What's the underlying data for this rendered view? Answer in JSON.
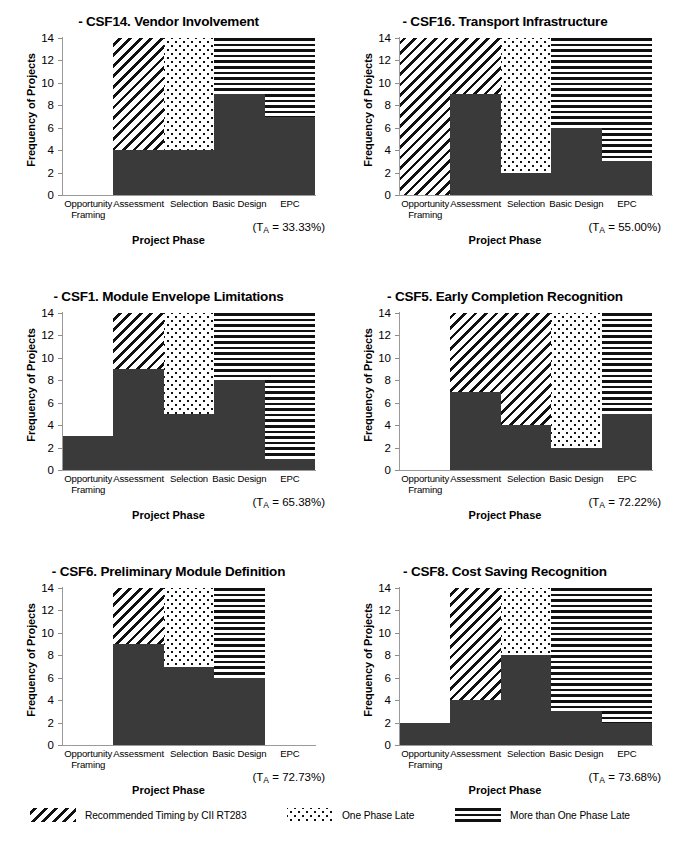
{
  "figure": {
    "axis": {
      "ylabel": "Frequency of Projects",
      "xlabel": "Project Phase",
      "yticks": [
        "14",
        "12",
        "10",
        "8",
        "6",
        "4",
        "2",
        "0"
      ],
      "ylim": [
        0,
        14
      ],
      "categories": [
        "Opportunity Framing",
        "Assessment",
        "Selection",
        "Basic Design",
        "EPC"
      ],
      "category_lines": [
        [
          "Opportunity",
          "Framing"
        ],
        [
          "Assessment",
          ""
        ],
        [
          "Selection",
          ""
        ],
        [
          "Basic Design",
          ""
        ],
        [
          "EPC",
          ""
        ]
      ]
    },
    "legend": {
      "items": [
        {
          "pattern": "hatch",
          "label": "Recommended Timing by CII RT283"
        },
        {
          "pattern": "dots",
          "label": "One Phase Late"
        },
        {
          "pattern": "lines",
          "label": "More than One Phase Late"
        }
      ]
    },
    "colors": {
      "bar_fill": "#3a3a3a",
      "pattern_ink": "#111111",
      "axis_line": "#9a9a9a",
      "background": "#ffffff"
    }
  },
  "chart_data": [
    {
      "type": "bar",
      "title": "- CSF14. Vendor Involvement",
      "xlabel": "Project Phase",
      "ylabel": "Frequency of Projects",
      "ylim": [
        0,
        14
      ],
      "categories": [
        "Opportunity Framing",
        "Assessment",
        "Selection",
        "Basic Design",
        "EPC"
      ],
      "values": [
        0,
        4,
        4,
        9,
        7
      ],
      "zones": [
        "blank",
        "hatch",
        "dots",
        "lines",
        "lines"
      ],
      "annotation": "(T_A = 33.33%)",
      "annotation_value": "33.33%"
    },
    {
      "type": "bar",
      "title": "- CSF16. Transport Infrastructure",
      "xlabel": "Project Phase",
      "ylabel": "Frequency of Projects",
      "ylim": [
        0,
        14
      ],
      "categories": [
        "Opportunity Framing",
        "Assessment",
        "Selection",
        "Basic Design",
        "EPC"
      ],
      "values": [
        0,
        9,
        2,
        6,
        3
      ],
      "zones": [
        "hatch",
        "hatch",
        "dots",
        "lines",
        "lines"
      ],
      "annotation": "(T_A = 55.00%)",
      "annotation_value": "55.00%"
    },
    {
      "type": "bar",
      "title": "- CSF1. Module Envelope Limitations",
      "xlabel": "Project Phase",
      "ylabel": "Frequency of Projects",
      "ylim": [
        0,
        14
      ],
      "categories": [
        "Opportunity Framing",
        "Assessment",
        "Selection",
        "Basic Design",
        "EPC"
      ],
      "values": [
        3,
        9,
        5,
        8,
        1
      ],
      "zones": [
        "blank",
        "hatch",
        "dots",
        "lines",
        "lines"
      ],
      "annotation": "(T_A = 65.38%)",
      "annotation_value": "65.38%"
    },
    {
      "type": "bar",
      "title": "- CSF5. Early Completion Recognition",
      "xlabel": "Project Phase",
      "ylabel": "Frequency of Projects",
      "ylim": [
        0,
        14
      ],
      "categories": [
        "Opportunity Framing",
        "Assessment",
        "Selection",
        "Basic Design",
        "EPC"
      ],
      "values": [
        0,
        7,
        4,
        2,
        5
      ],
      "zones": [
        "blank",
        "hatch",
        "hatch",
        "dots",
        "lines"
      ],
      "annotation": "(T_A = 72.22%)",
      "annotation_value": "72.22%"
    },
    {
      "type": "bar",
      "title": "- CSF6. Preliminary Module Definition",
      "xlabel": "Project Phase",
      "ylabel": "Frequency of Projects",
      "ylim": [
        0,
        14
      ],
      "categories": [
        "Opportunity Framing",
        "Assessment",
        "Selection",
        "Basic Design",
        "EPC"
      ],
      "values": [
        0,
        9,
        7,
        6,
        0
      ],
      "zones": [
        "blank",
        "hatch",
        "dots",
        "lines",
        "blank"
      ],
      "annotation": "(T_A = 72.73%)",
      "annotation_value": "72.73%"
    },
    {
      "type": "bar",
      "title": "- CSF8. Cost Saving Recognition",
      "xlabel": "Project Phase",
      "ylabel": "Frequency of Projects",
      "ylim": [
        0,
        14
      ],
      "categories": [
        "Opportunity Framing",
        "Assessment",
        "Selection",
        "Basic Design",
        "EPC"
      ],
      "values": [
        2,
        4,
        8,
        3,
        2
      ],
      "zones": [
        "blank",
        "hatch",
        "dots",
        "lines",
        "lines"
      ],
      "annotation": "(T_A = 73.68%)",
      "annotation_value": "73.68%"
    }
  ]
}
